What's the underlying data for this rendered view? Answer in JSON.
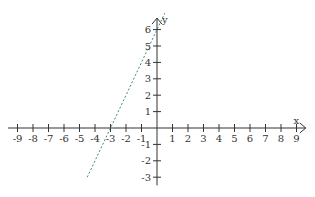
{
  "graph": {
    "x_axis_label": "x",
    "y_axis_label": "y",
    "x_ticks": [
      "-9",
      "-8",
      "-7",
      "-6",
      "-5",
      "-4",
      "-3",
      "-2",
      "-1",
      "1",
      "2",
      "3",
      "4",
      "5",
      "6",
      "7",
      "8",
      "9"
    ],
    "y_ticks": [
      "6",
      "5",
      "4",
      "3",
      "2",
      "1",
      "-1",
      "-2",
      "-3"
    ],
    "line_color": "#3a8a7a",
    "axis_color": "#333333"
  },
  "chart_data": {
    "type": "line",
    "title": "",
    "xlabel": "x",
    "ylabel": "y",
    "xlim": [
      -9,
      9
    ],
    "ylim": [
      -3,
      6
    ],
    "series": [
      {
        "name": "y = 2x + 6",
        "style": "dashed",
        "x": [
          -4.5,
          -3,
          0,
          0.5
        ],
        "y": [
          -3,
          0,
          6,
          7
        ]
      }
    ]
  }
}
